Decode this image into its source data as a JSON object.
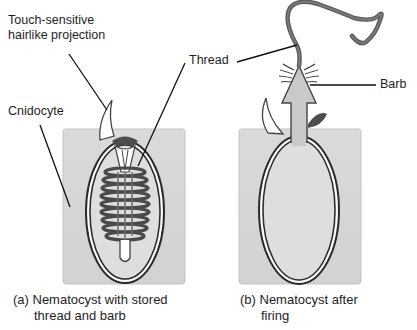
{
  "diagram": {
    "labels": {
      "touch_sensitive_line1": "Touch-sensitive",
      "touch_sensitive_line2": "hairlike projection",
      "thread": "Thread",
      "cnidocyte": "Cnidocyte",
      "barb": "Barb"
    },
    "captions": {
      "a_line1": "(a) Nematocyst with stored",
      "a_line2": "thread and barb",
      "b_line1": "(b) Nematocyst after",
      "b_line2": "firing"
    },
    "colors": {
      "cell_fill": "#d6d6d6",
      "capsule_outline": "#2b2b2b",
      "thread_fill": "#5a5a5a",
      "barb_fill": "#c9c9c9",
      "leader_line": "#111111"
    }
  }
}
